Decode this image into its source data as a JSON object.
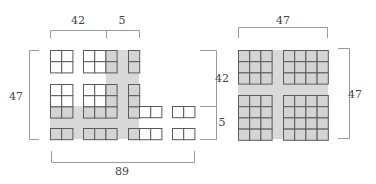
{
  "colors": {
    "shade": "#d9d9d9",
    "cell_stroke": "#5a5a5a",
    "cell_fill_white": "#ffffff",
    "cell_fill_gray": "#d4d4d4",
    "bracket": "#9a9a9a",
    "text": "#444444"
  },
  "left_diagram": {
    "labels": {
      "top_left": "42",
      "top_right": "5",
      "left": "47",
      "bottom": "89"
    },
    "shade_regions": [
      {
        "x": 106,
        "y": 50,
        "w": 33,
        "h": 89
      },
      {
        "x": 50,
        "y": 106,
        "w": 89,
        "h": 33
      }
    ],
    "blocks": [
      {
        "x": 50,
        "y": 50,
        "cols": 2,
        "rows": 2,
        "gray": []
      },
      {
        "x": 83,
        "y": 50,
        "cols": 3,
        "rows": 2,
        "gray": [
          [
            0,
            2
          ],
          [
            1,
            2
          ]
        ]
      },
      {
        "x": 128,
        "y": 50,
        "cols": 1,
        "rows": 2,
        "gray": [
          [
            0,
            0
          ],
          [
            1,
            0
          ]
        ]
      },
      {
        "x": 50,
        "y": 84,
        "cols": 2,
        "rows": 3,
        "gray": [
          [
            2,
            0
          ],
          [
            2,
            1
          ]
        ]
      },
      {
        "x": 83,
        "y": 84,
        "cols": 3,
        "rows": 3,
        "gray": [
          [
            0,
            2
          ],
          [
            1,
            2
          ],
          [
            2,
            0
          ],
          [
            2,
            1
          ],
          [
            2,
            2
          ]
        ]
      },
      {
        "x": 128,
        "y": 84,
        "cols": 1,
        "rows": 3,
        "gray": [
          [
            0,
            0
          ],
          [
            1,
            0
          ],
          [
            2,
            0
          ]
        ]
      },
      {
        "x": 139,
        "y": 106,
        "cols": 2,
        "rows": 1,
        "gray": []
      },
      {
        "x": 172,
        "y": 106,
        "cols": 2,
        "rows": 1,
        "gray": []
      },
      {
        "x": 50,
        "y": 128,
        "cols": 2,
        "rows": 1,
        "gray": [
          [
            0,
            0
          ],
          [
            0,
            1
          ]
        ]
      },
      {
        "x": 83,
        "y": 128,
        "cols": 3,
        "rows": 1,
        "gray": [
          [
            0,
            0
          ],
          [
            0,
            1
          ],
          [
            0,
            2
          ]
        ]
      },
      {
        "x": 128,
        "y": 128,
        "cols": 1,
        "rows": 1,
        "gray": [
          [
            0,
            0
          ]
        ]
      },
      {
        "x": 139,
        "y": 128,
        "cols": 2,
        "rows": 1,
        "gray": []
      },
      {
        "x": 172,
        "y": 128,
        "cols": 2,
        "rows": 1,
        "gray": []
      }
    ]
  },
  "right_diagram": {
    "labels": {
      "top": "47",
      "left_upper": "42",
      "left_lower": "5",
      "right": "47"
    },
    "shade_region": {
      "x": 238,
      "y": 50,
      "w": 90,
      "h": 89
    },
    "blocks": [
      {
        "x": 238,
        "y": 50,
        "cols": 3,
        "rows": 3
      },
      {
        "x": 283,
        "y": 50,
        "cols": 4,
        "rows": 3
      },
      {
        "x": 238,
        "y": 95,
        "cols": 3,
        "rows": 4
      },
      {
        "x": 283,
        "y": 95,
        "cols": 4,
        "rows": 4
      }
    ]
  },
  "cell_size": 11.2
}
